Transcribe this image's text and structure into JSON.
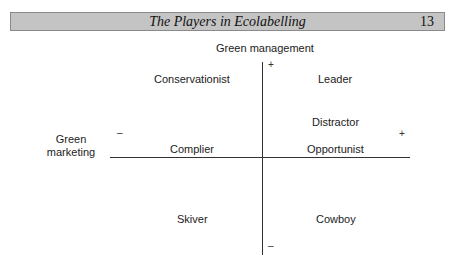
{
  "header": {
    "title": "The Players in Ecolabelling",
    "page_number": "13"
  },
  "diagram": {
    "y_axis": {
      "label": "Green management",
      "plus": "+",
      "minus": "–"
    },
    "x_axis": {
      "label_line1": "Green",
      "label_line2": "marketing",
      "plus": "+",
      "minus": "–"
    },
    "quadrant_labels": {
      "top_left": "Conservationist",
      "top_right": "Leader",
      "mid_right": "Distractor",
      "bottom_left_axis": "Complier",
      "bottom_right_axis": "Opportunist",
      "lower_left": "Skiver",
      "lower_right": "Cowboy"
    }
  }
}
